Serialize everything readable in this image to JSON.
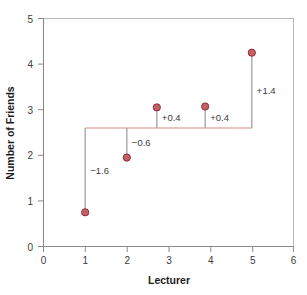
{
  "chart_data": {
    "type": "scatter",
    "title": "",
    "xlabel": "Lecturer",
    "ylabel": "Number of Friends",
    "xlim": [
      0,
      6
    ],
    "ylim": [
      0,
      5
    ],
    "xticks": [
      "0",
      "1",
      "2",
      "3",
      "4",
      "5",
      "6"
    ],
    "yticks": [
      "0",
      "1",
      "2",
      "3",
      "4",
      "5"
    ],
    "xtick_values": [
      0,
      1,
      2,
      3,
      4,
      5,
      6
    ],
    "ytick_values": [
      0,
      1,
      2,
      3,
      4,
      5
    ],
    "grid": false,
    "legend": "none",
    "mean_line": {
      "value": 2.6,
      "x_start": 1,
      "x_end": 5,
      "color": "#d98a86",
      "label": ""
    },
    "points": [
      {
        "x": 1,
        "y": 0.75,
        "deviation": "−1.6",
        "deviation_value": -1.6,
        "label_side": "right"
      },
      {
        "x": 2,
        "y": 1.95,
        "deviation": "−0.6",
        "deviation_value": -0.6,
        "label_side": "right"
      },
      {
        "x": 2.72,
        "y": 3.05,
        "deviation": "+0.4",
        "deviation_value": 0.4,
        "label_side": "right"
      },
      {
        "x": 3.88,
        "y": 3.07,
        "deviation": "+0.4",
        "deviation_value": 0.4,
        "label_side": "right"
      },
      {
        "x": 5,
        "y": 4.25,
        "deviation": "+1.4",
        "deviation_value": 1.4,
        "label_side": "right"
      }
    ],
    "marker_fill": "#c4606a",
    "marker_stroke": "#8f2b33",
    "deviation_line_color": "#9a9a9a",
    "axis_color": "#8a8a8a",
    "background": "#ffffff"
  }
}
